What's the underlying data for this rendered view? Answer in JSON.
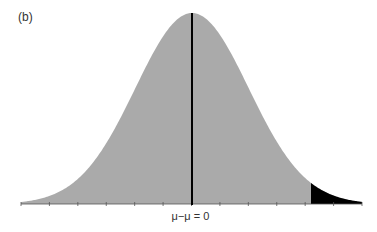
{
  "panel_label": "(b)",
  "x_axis_label": "μ−μ = 0",
  "colors": {
    "curve_fill": "#aaaaaa",
    "tail_fill": "#000000",
    "center_line": "#000000",
    "axis": "#555555"
  },
  "chart_data": {
    "type": "area",
    "title": "",
    "xlabel": "μ−μ = 0",
    "ylabel": "",
    "center": 0,
    "x_range_sd": [
      -3,
      3
    ],
    "tick_count": 13,
    "shaded_tail": {
      "side": "right",
      "start_sd": 2.1
    },
    "grid": false
  }
}
